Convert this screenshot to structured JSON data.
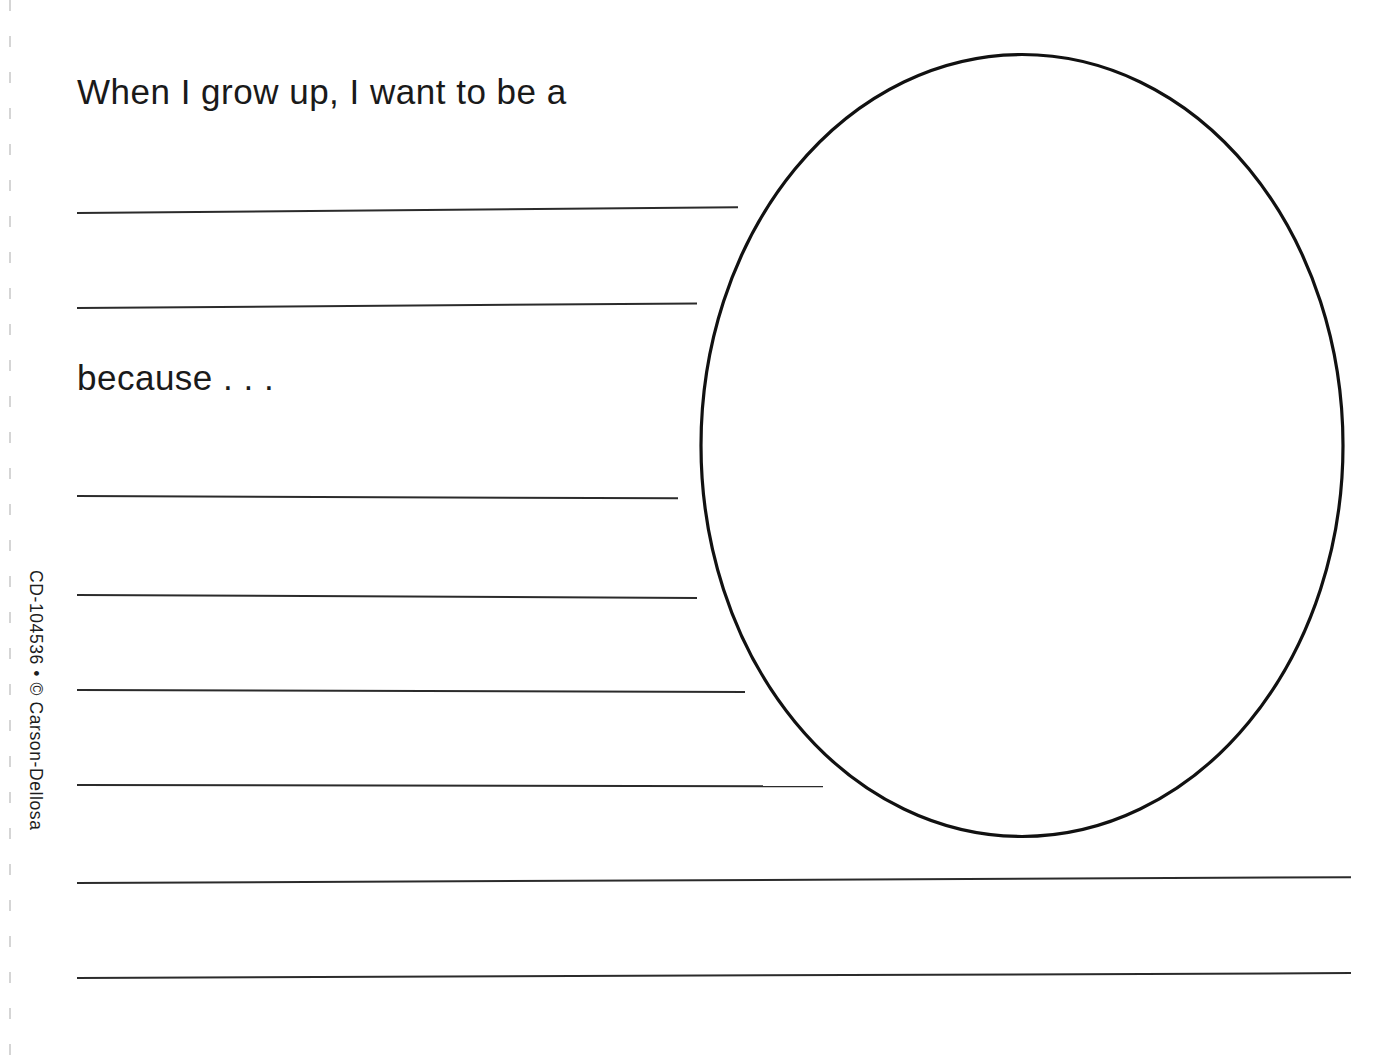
{
  "worksheet": {
    "background_color": "#ffffff",
    "ink_color": "#1a1a1a",
    "prompts": {
      "line_1": "When I grow up, I want to be a",
      "line_2": "because . . ."
    },
    "footer": {
      "copyright": "CD-104536 • © Carson-Dellosa"
    },
    "drawing_area": {
      "shape": "oval",
      "stroke_color": "#111111",
      "stroke_width": 3
    },
    "writing_lines": [
      {
        "id": 1,
        "left": 77,
        "top": 212,
        "width": 661,
        "angle": -0.5
      },
      {
        "id": 2,
        "left": 77,
        "top": 307,
        "width": 620,
        "angle": -0.42
      },
      {
        "id": 3,
        "left": 77,
        "top": 495,
        "width": 601,
        "angle": 0.22
      },
      {
        "id": 4,
        "left": 77,
        "top": 594,
        "width": 620,
        "angle": 0.28
      },
      {
        "id": 5,
        "left": 77,
        "top": 689,
        "width": 668,
        "angle": 0.18
      },
      {
        "id": 6,
        "left": 77,
        "top": 784,
        "width": 746,
        "angle": 0.1
      },
      {
        "id": 7,
        "left": 77,
        "top": 882,
        "width": 1274,
        "angle": -0.26
      },
      {
        "id": 8,
        "left": 77,
        "top": 977,
        "width": 1274,
        "angle": -0.22
      }
    ],
    "perforation": {
      "label": "tear-line",
      "color": "#c9c9c9"
    }
  }
}
